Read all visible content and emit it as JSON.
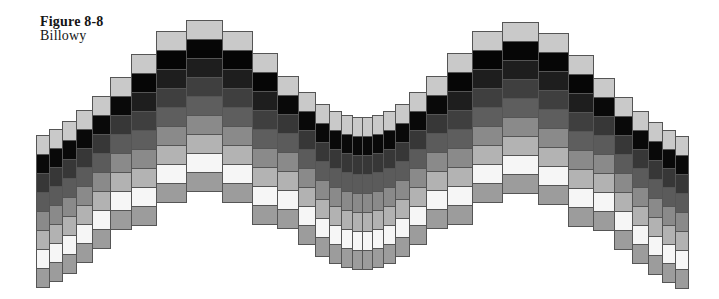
{
  "caption": {
    "title": "Figure 8-8",
    "subtitle": "Billowy"
  },
  "figure": {
    "type": "stepped-billow-grid",
    "description_colors": {
      "background": "#ffffff",
      "cell_border": "#555555",
      "top_cap": "#c9c9c9",
      "bottom_cap": "#9c9c9c",
      "darkest": "#060606",
      "lightest": "#f6f6f6"
    },
    "cell_height": 19,
    "border_color": "#555555",
    "ramps": {
      "tall": [
        "#c9c9c9",
        "#060606",
        "#1e1e1e",
        "#3f3f3f",
        "#5e5e5e",
        "#8a8a8a",
        "#b3b3b3",
        "#f6f6f6",
        "#9c9c9c"
      ],
      "short": [
        "#c9c9c9",
        "#090909",
        "#373737",
        "#5b5b5b",
        "#8a8a8a",
        "#b2b2b2",
        "#f6f6f6",
        "#9c9c9c"
      ]
    },
    "columns": [
      {
        "x": 36,
        "w": 13,
        "top": 135,
        "ramp": "short"
      },
      {
        "x": 49,
        "w": 13,
        "top": 129,
        "ramp": "short"
      },
      {
        "x": 62,
        "w": 14,
        "top": 121,
        "ramp": "short"
      },
      {
        "x": 76,
        "w": 16,
        "top": 110,
        "ramp": "short"
      },
      {
        "x": 92,
        "w": 18,
        "top": 96,
        "ramp": "short"
      },
      {
        "x": 110,
        "w": 21,
        "top": 77,
        "ramp": "short"
      },
      {
        "x": 131,
        "w": 25,
        "top": 54,
        "ramp": "tall"
      },
      {
        "x": 156,
        "w": 30,
        "top": 31,
        "ramp": "tall"
      },
      {
        "x": 186,
        "w": 36,
        "top": 20,
        "ramp": "tall"
      },
      {
        "x": 222,
        "w": 30,
        "top": 31,
        "ramp": "tall"
      },
      {
        "x": 252,
        "w": 25,
        "top": 53,
        "ramp": "tall"
      },
      {
        "x": 277,
        "w": 21,
        "top": 76,
        "ramp": "short"
      },
      {
        "x": 298,
        "w": 17,
        "top": 92,
        "ramp": "short"
      },
      {
        "x": 315,
        "w": 14,
        "top": 104,
        "ramp": "short"
      },
      {
        "x": 329,
        "w": 12,
        "top": 111,
        "ramp": "short"
      },
      {
        "x": 341,
        "w": 11,
        "top": 115,
        "ramp": "short"
      },
      {
        "x": 352,
        "w": 10,
        "top": 117,
        "ramp": "short"
      },
      {
        "x": 362,
        "w": 10,
        "top": 117,
        "ramp": "short"
      },
      {
        "x": 372,
        "w": 11,
        "top": 115,
        "ramp": "short"
      },
      {
        "x": 383,
        "w": 12,
        "top": 111,
        "ramp": "short"
      },
      {
        "x": 395,
        "w": 14,
        "top": 104,
        "ramp": "short"
      },
      {
        "x": 409,
        "w": 17,
        "top": 92,
        "ramp": "short"
      },
      {
        "x": 426,
        "w": 21,
        "top": 76,
        "ramp": "short"
      },
      {
        "x": 447,
        "w": 25,
        "top": 53,
        "ramp": "tall"
      },
      {
        "x": 472,
        "w": 30,
        "top": 31,
        "ramp": "tall"
      },
      {
        "x": 502,
        "w": 36,
        "top": 22,
        "ramp": "tall"
      },
      {
        "x": 538,
        "w": 30,
        "top": 33,
        "ramp": "tall"
      },
      {
        "x": 568,
        "w": 25,
        "top": 55,
        "ramp": "tall"
      },
      {
        "x": 593,
        "w": 21,
        "top": 78,
        "ramp": "short"
      },
      {
        "x": 614,
        "w": 18,
        "top": 97,
        "ramp": "short"
      },
      {
        "x": 632,
        "w": 16,
        "top": 111,
        "ramp": "short"
      },
      {
        "x": 648,
        "w": 14,
        "top": 122,
        "ramp": "short"
      },
      {
        "x": 662,
        "w": 13,
        "top": 130,
        "ramp": "short"
      },
      {
        "x": 675,
        "w": 13,
        "top": 136,
        "ramp": "short"
      }
    ]
  }
}
